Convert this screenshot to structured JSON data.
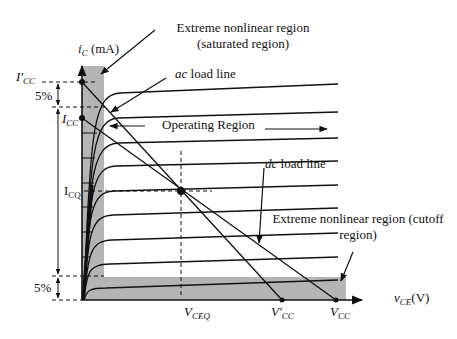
{
  "diagram": {
    "axes": {
      "y_label_var": "i",
      "y_label_sub": "C",
      "y_label_unit": "(mA)",
      "x_label_var": "v",
      "x_label_sub": "CE",
      "x_label_unit": "(V)"
    },
    "y_markers": {
      "icc_prime_main": "I'",
      "icc_prime_sub": "CC",
      "icc_main": "I",
      "icc_sub": "CC",
      "icq_main": "I",
      "icq_sub": "CQ",
      "top_percent": "5%",
      "bottom_percent": "5%"
    },
    "x_markers": {
      "vceq_main": "V",
      "vceq_sub": "CEQ",
      "vcc_prime_main": "V'",
      "vcc_prime_sub": "CC",
      "vcc_main": "V",
      "vcc_sub": "CC"
    },
    "annotations": {
      "saturated_line1": "Extreme nonlinear region",
      "saturated_line2": "(saturated region)",
      "ac_load_line_italic": "ac",
      "ac_load_line_rest": " load line",
      "operating_region": "Operating Region",
      "dc_load_line_italic": "dc",
      "dc_load_line_rest": " load line",
      "cutoff_line1": "Extreme nonlinear region (cutoff",
      "cutoff_line2": "region)"
    },
    "colors": {
      "ink": "#111111",
      "shade": "#b4b4b4",
      "background": "#ffffff"
    }
  }
}
